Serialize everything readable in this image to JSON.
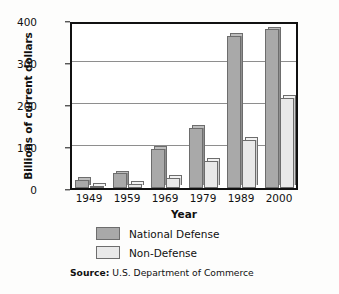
{
  "chart_data": {
    "type": "bar",
    "title": "",
    "subtitle": "",
    "xlabel": "Year",
    "ylabel": "Billions of current dollars",
    "categories": [
      "1949",
      "1959",
      "1969",
      "1979",
      "1989",
      "2000"
    ],
    "series": [
      {
        "name": "National Defense",
        "color": "#a9a9a9",
        "values": [
          20,
          35,
          93,
          143,
          363,
          378
        ]
      },
      {
        "name": "Non-Defense",
        "color": "#e9e9e9",
        "values": [
          5,
          10,
          25,
          65,
          115,
          215
        ]
      }
    ],
    "ylim": [
      0,
      400
    ],
    "yticks": [
      0,
      100,
      200,
      300,
      400
    ],
    "ytick_labels": [
      "0",
      "100",
      "200",
      "300",
      "400"
    ],
    "grid": true,
    "legend_position": "below-axes",
    "annotations": {
      "source_lead": "Source:",
      "source_text": " U.S. Department of Commerce"
    }
  }
}
